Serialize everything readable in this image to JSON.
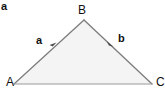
{
  "figure": {
    "panel_label": "a",
    "title": "",
    "background_color": "#ffffff",
    "triangle": {
      "fill_color": "#f4f4f4",
      "stroke_color": "#808080",
      "stroke_width": 1.2,
      "vertices": [
        {
          "name": "A",
          "label": "A",
          "x": 14,
          "y": 84
        },
        {
          "name": "B",
          "label": "B",
          "x": 84,
          "y": 20
        },
        {
          "name": "C",
          "label": "C",
          "x": 152,
          "y": 84
        }
      ]
    },
    "vectors": [
      {
        "name": "vector-a",
        "label": "a",
        "from": "A",
        "to": "B",
        "arrow_x": 54,
        "arrow_y": 45,
        "color": "#555555"
      },
      {
        "name": "vector-b",
        "label": "b",
        "from": "B",
        "to": "C",
        "arrow_x": 111,
        "arrow_y": 44,
        "color": "#555555"
      }
    ],
    "base_edge": {
      "from": "A",
      "to": "C",
      "color": "#9a9a9a"
    }
  }
}
